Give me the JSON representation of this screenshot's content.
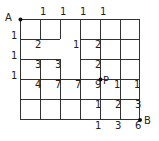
{
  "diagram": {
    "point_a_label": "A",
    "point_b_label": "B",
    "point_p_label": "P",
    "line_color": "#333333",
    "vertex_counts": [
      {
        "x": 40,
        "y": 12,
        "value": "1"
      },
      {
        "x": 60,
        "y": 12,
        "value": "1"
      },
      {
        "x": 80,
        "y": 12,
        "value": "1"
      },
      {
        "x": 100,
        "y": 12,
        "value": "1"
      },
      {
        "x": 11,
        "y": 36,
        "value": "1"
      },
      {
        "x": 11,
        "y": 56,
        "value": "1"
      },
      {
        "x": 11,
        "y": 76,
        "value": "1"
      },
      {
        "x": 35,
        "y": 45,
        "value": "2"
      },
      {
        "x": 73,
        "y": 45,
        "value": "1"
      },
      {
        "x": 95,
        "y": 45,
        "value": "2"
      },
      {
        "x": 35,
        "y": 65,
        "value": "3"
      },
      {
        "x": 55,
        "y": 65,
        "value": "3"
      },
      {
        "x": 95,
        "y": 65,
        "value": "2"
      },
      {
        "x": 35,
        "y": 85,
        "value": "4"
      },
      {
        "x": 55,
        "y": 85,
        "value": "7"
      },
      {
        "x": 75,
        "y": 85,
        "value": "7"
      },
      {
        "x": 95,
        "y": 85,
        "value": "9"
      },
      {
        "x": 114,
        "y": 85,
        "value": "1"
      },
      {
        "x": 134,
        "y": 85,
        "value": "1"
      },
      {
        "x": 95,
        "y": 105,
        "value": "1"
      },
      {
        "x": 115,
        "y": 105,
        "value": "2"
      },
      {
        "x": 135,
        "y": 105,
        "value": "3"
      },
      {
        "x": 95,
        "y": 126,
        "value": "1"
      },
      {
        "x": 115,
        "y": 126,
        "value": "3"
      },
      {
        "x": 135,
        "y": 126,
        "value": "6"
      }
    ]
  }
}
